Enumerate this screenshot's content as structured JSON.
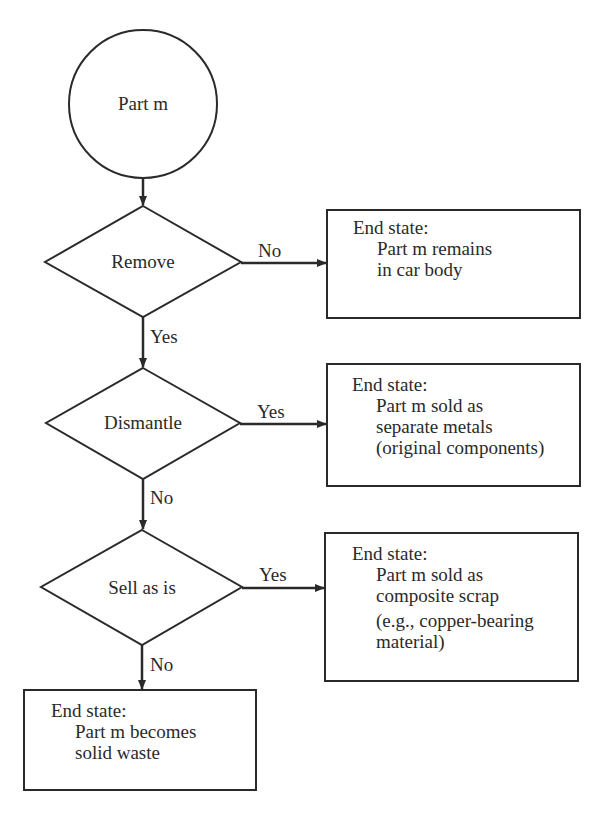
{
  "start": {
    "label": "Part m"
  },
  "decisions": [
    {
      "label": "Remove",
      "side_branch": "No",
      "down_branch": "Yes"
    },
    {
      "label": "Dismantle",
      "side_branch": "Yes",
      "down_branch": "No"
    },
    {
      "label": "Sell as is",
      "side_branch": "Yes",
      "down_branch": "No"
    }
  ],
  "end_states": [
    {
      "heading": "End state:",
      "lines": [
        "Part m remains",
        "in car body"
      ]
    },
    {
      "heading": "End state:",
      "lines": [
        "Part m sold as",
        "separate metals",
        "(original components)"
      ]
    },
    {
      "heading": "End state:",
      "lines": [
        "Part m  sold as",
        "composite scrap",
        "(e.g., copper-bearing",
        "material)"
      ]
    },
    {
      "heading": "End state:",
      "lines": [
        "Part m becomes",
        "solid waste"
      ]
    }
  ],
  "colors": {
    "stroke": "#2a2a2a",
    "background": "#ffffff"
  }
}
